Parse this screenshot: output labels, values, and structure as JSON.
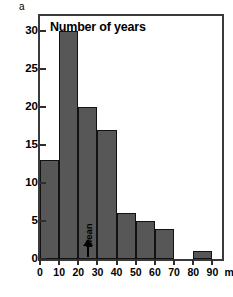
{
  "panel": {
    "label": "a"
  },
  "chart_data": {
    "type": "bar",
    "title": "Number of years",
    "xlabel": "mm/a",
    "ylabel": "Number of years",
    "categories": [
      "0-10",
      "10-20",
      "20-30",
      "30-40",
      "40-50",
      "50-60",
      "60-70",
      "70-80",
      "80-90"
    ],
    "bin_edges": [
      0,
      10,
      20,
      30,
      40,
      50,
      60,
      70,
      80,
      90
    ],
    "values": [
      13,
      30,
      20,
      17,
      6,
      5,
      4,
      0,
      1
    ],
    "xlim": [
      0,
      95
    ],
    "ylim": [
      0,
      32
    ],
    "xticks": [
      0,
      10,
      20,
      30,
      40,
      50,
      60,
      70,
      80,
      90
    ],
    "xtick_labels": [
      "0",
      "10",
      "20",
      "30",
      "40",
      "50",
      "60",
      "70",
      "80",
      "90"
    ],
    "yticks": [
      0,
      5,
      10,
      15,
      20,
      25,
      30
    ],
    "ytick_labels": [
      "0",
      "5",
      "10",
      "15",
      "20",
      "25",
      "30"
    ],
    "grid": false,
    "legend": false,
    "annotations": [
      {
        "text": "Mean",
        "x": 25,
        "orientation": "vertical",
        "arrow": "up"
      }
    ],
    "bar_color": "#575757",
    "bar_edge_color": "#121212",
    "frame_color": "#3a3a3a",
    "background": "#ffffff"
  }
}
